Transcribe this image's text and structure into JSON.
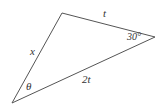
{
  "diagram": {
    "type": "triangle",
    "stroke_color": "#555555",
    "vertices": {
      "top": [
        62,
        13
      ],
      "right": [
        155,
        37
      ],
      "bottom_left": [
        12,
        103
      ]
    },
    "sides": [
      {
        "name": "left",
        "label": "x"
      },
      {
        "name": "top",
        "label": "t"
      },
      {
        "name": "bottom",
        "label": "2t"
      }
    ],
    "angles": [
      {
        "vertex": "right",
        "label": "30°"
      },
      {
        "vertex": "bottom_left",
        "label": "θ"
      }
    ]
  }
}
